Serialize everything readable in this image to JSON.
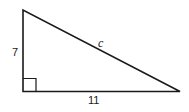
{
  "figure": {
    "type": "right-triangle",
    "vertices": {
      "top": [
        23,
        10
      ],
      "right_angle": [
        23,
        91
      ],
      "right": [
        180,
        92
      ]
    },
    "right_angle_marker_size": 13,
    "stroke_color": "#1a1a1a",
    "labels": {
      "vertical_leg": "7",
      "horizontal_leg": "11",
      "hypotenuse": "c"
    }
  }
}
